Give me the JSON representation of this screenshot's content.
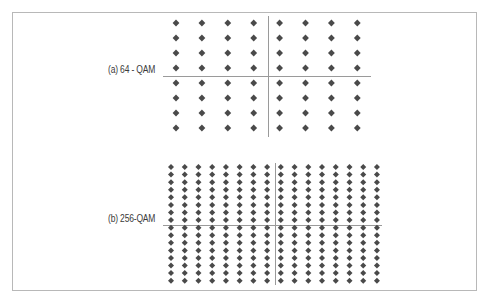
{
  "figure": {
    "frame": {
      "left": 12,
      "top": 12,
      "width": 465,
      "height": 279,
      "border_color": "#b8b8b8"
    },
    "dot_color": "#4a4a4a",
    "axis_color": "#9a9a9a",
    "panels": [
      {
        "id": "a",
        "label": "(a) 64 - QAM",
        "label_pos": {
          "x": 108,
          "y": 70
        },
        "rows": 8,
        "cols": 8,
        "x_start": 176,
        "x_step": 25.9,
        "y_start": 23,
        "y_step": 15.0,
        "dot_size": 3.4,
        "axis_h": {
          "x1": 163,
          "x2": 371,
          "y": 76
        },
        "axis_v": {
          "x": 268,
          "y1": 16,
          "y2": 137
        }
      },
      {
        "id": "b",
        "label": "(b) 256-QAM",
        "label_pos": {
          "x": 108,
          "y": 219
        },
        "rows": 16,
        "cols": 16,
        "x_start": 171,
        "x_step": 13.73,
        "y_start": 167,
        "y_step": 7.58,
        "dot_size": 3.0,
        "axis_h": {
          "x1": 163,
          "x2": 382,
          "y": 225
        },
        "axis_v": {
          "x": 275,
          "y1": 163,
          "y2": 285
        }
      }
    ]
  }
}
